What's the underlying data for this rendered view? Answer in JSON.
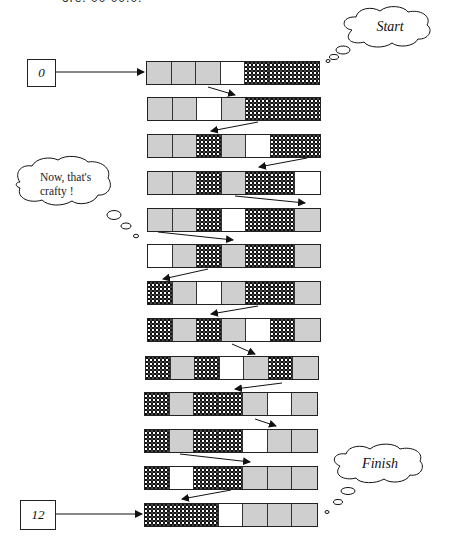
{
  "header": {
    "partial_text": "ore. 00 00.0."
  },
  "legend": {
    "cell_types": {
      "G": "grey",
      "W": "empty",
      "D": "dotted"
    },
    "colors": {
      "grey": "#cfcfcf",
      "empty": "#ffffff",
      "dotted": "#111111"
    }
  },
  "start_counter": {
    "label": "0"
  },
  "end_counter": {
    "label": "12"
  },
  "clouds": {
    "start": {
      "label": "Start"
    },
    "finish": {
      "label": "Finish"
    },
    "note": {
      "line1": "Now, that's",
      "line2": "crafty !"
    }
  },
  "rows": [
    {
      "step": 0,
      "cells": [
        "G",
        "G",
        "G",
        "W",
        "D",
        "D",
        "D"
      ]
    },
    {
      "step": 1,
      "cells": [
        "G",
        "G",
        "W",
        "G",
        "D",
        "D",
        "D"
      ]
    },
    {
      "step": 2,
      "cells": [
        "G",
        "G",
        "D",
        "G",
        "W",
        "D",
        "D"
      ]
    },
    {
      "step": 3,
      "cells": [
        "G",
        "G",
        "D",
        "G",
        "D",
        "D",
        "W"
      ]
    },
    {
      "step": 4,
      "cells": [
        "G",
        "G",
        "D",
        "W",
        "D",
        "D",
        "G"
      ]
    },
    {
      "step": 5,
      "cells": [
        "W",
        "G",
        "D",
        "G",
        "D",
        "D",
        "G"
      ]
    },
    {
      "step": 6,
      "cells": [
        "D",
        "G",
        "W",
        "G",
        "D",
        "D",
        "G"
      ]
    },
    {
      "step": 7,
      "cells": [
        "D",
        "G",
        "D",
        "G",
        "W",
        "D",
        "G"
      ]
    },
    {
      "step": 8,
      "cells": [
        "D",
        "G",
        "D",
        "W",
        "G",
        "D",
        "G"
      ]
    },
    {
      "step": 9,
      "cells": [
        "D",
        "G",
        "D",
        "D",
        "G",
        "W",
        "G"
      ]
    },
    {
      "step": 10,
      "cells": [
        "D",
        "G",
        "D",
        "D",
        "W",
        "G",
        "G"
      ]
    },
    {
      "step": 11,
      "cells": [
        "D",
        "W",
        "D",
        "D",
        "G",
        "G",
        "G"
      ]
    },
    {
      "step": 12,
      "cells": [
        "D",
        "D",
        "D",
        "W",
        "G",
        "G",
        "G"
      ]
    }
  ]
}
